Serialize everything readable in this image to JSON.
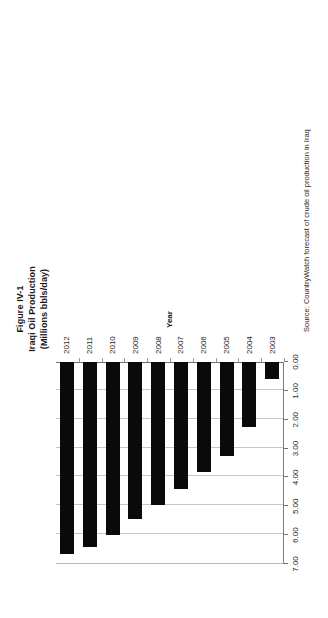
{
  "figure": {
    "title_lines": [
      "Figure IV-1",
      "Iraqi Oil Production",
      "(Millions bbls/day)"
    ],
    "source_note": "Source: CountryWatch forecast of  crude oil production in Iraq",
    "category_axis_title": "Year",
    "bar_color": "#0a0a0a",
    "gridline_color": "#c6c6c6",
    "axis_color": "#6f6f6f"
  },
  "chart_data": {
    "type": "bar",
    "orientation": "horizontal",
    "xlabel": "Millions bbls/day",
    "ylabel": "Year",
    "categories": [
      "2012",
      "2011",
      "2010",
      "2009",
      "2008",
      "2007",
      "2006",
      "2005",
      "2004",
      "2003"
    ],
    "values": [
      6.65,
      6.4,
      6.0,
      5.45,
      4.95,
      4.4,
      3.8,
      3.25,
      2.25,
      0.6
    ],
    "value_ticks": [
      "7.00",
      "6.00",
      "5.00",
      "4.00",
      "3.00",
      "2.00",
      "1.00",
      "0.00"
    ],
    "value_tick_numbers": [
      7,
      6,
      5,
      4,
      3,
      2,
      1,
      0
    ],
    "xlim": [
      0,
      7
    ],
    "grid": true,
    "legend": "none",
    "value_axis_inverted": true
  }
}
